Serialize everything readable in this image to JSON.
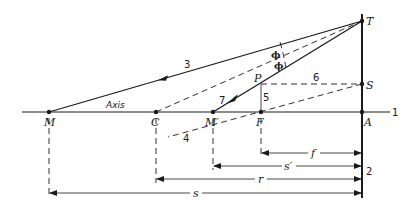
{
  "diagram": {
    "type": "optics-ray-diagram",
    "points": {
      "M": "M",
      "C": "C",
      "M_prime": "M′",
      "F": "F",
      "A": "A",
      "T": "T",
      "S": "S",
      "P": "P"
    },
    "axis_label": "Axis",
    "angle_labels": [
      "ϕ",
      "ϕ"
    ],
    "line_numbers": {
      "axis": "1",
      "mirror": "2",
      "incident_ray": "3",
      "dashed_ray_through_focus": "4",
      "vertical_from_P": "5",
      "horizontal_P_to_S": "6",
      "reflected_ray": "7"
    },
    "dimensions": {
      "f": "f",
      "s_prime": "s′",
      "r": "r",
      "s": "s"
    }
  }
}
